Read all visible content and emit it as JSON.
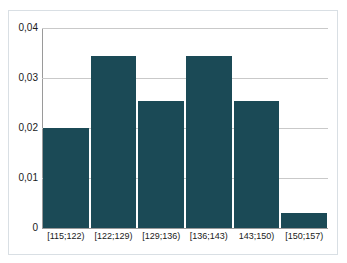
{
  "chart_data": {
    "type": "bar",
    "title": "",
    "subtitle": "",
    "xlabel": "",
    "ylabel": "",
    "categories": [
      "[115;122)",
      "[122;129)",
      "[129;136)",
      "[136;143)",
      "143;150)",
      "[150;157)"
    ],
    "values": [
      0.02,
      0.0345,
      0.0255,
      0.0345,
      0.0255,
      0.003
    ],
    "ylim": [
      0,
      0.04
    ],
    "y_ticks": [
      0,
      0.01,
      0.02,
      0.03,
      0.04
    ],
    "y_tick_labels": [
      "0",
      "0,01",
      "0,02",
      "0,03",
      "0,04"
    ],
    "grid": true,
    "legend": null,
    "legend_position": "none",
    "series": [
      {
        "name": "",
        "values": [
          0.02,
          0.0345,
          0.0255,
          0.0345,
          0.0255,
          0.003
        ]
      }
    ],
    "colors": {
      "bar": "#1b4a56",
      "gridline": "#c9c9c9",
      "axis": "#9a9a9a",
      "frame": "#d9dfe4",
      "background": "#ffffff",
      "text": "#1a1a1a"
    }
  }
}
